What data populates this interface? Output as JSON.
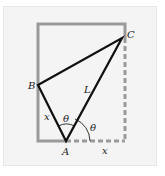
{
  "diagram": {
    "title": "",
    "colors": {
      "background": "#f4f4f4",
      "rectangle": "#9a9a9a",
      "fold_lines": "#111111",
      "arc": "#333333"
    },
    "points": {
      "A": {
        "label": "A",
        "x": 66,
        "y": 141
      },
      "B": {
        "label": "B",
        "x": 38,
        "y": 85
      },
      "C": {
        "label": "C",
        "x": 122,
        "y": 38
      }
    },
    "rectangle": {
      "left": 38,
      "top": 24,
      "right": 125,
      "bottom": 141
    },
    "labels": {
      "point_a": "A",
      "point_b": "B",
      "point_c": "C",
      "segment_ab": "x",
      "segment_ac": "L",
      "bottom_x": "x",
      "angle_top": "θ",
      "angle_right": "θ"
    }
  }
}
